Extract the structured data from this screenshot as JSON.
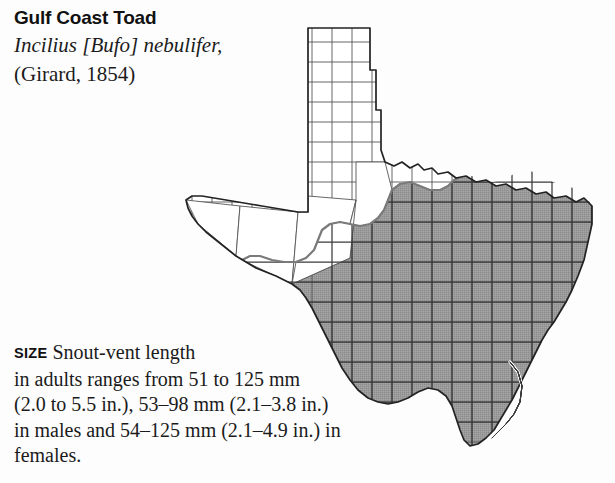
{
  "species": {
    "common_name": "Gulf Coast Toad",
    "scientific_name": "Incilius [Bufo] nebulifer,",
    "authority": "(Girard, 1854)"
  },
  "size_section": {
    "label": "SIZE",
    "lines": [
      " Snout-vent length",
      "in adults ranges from 51 to 125 mm",
      "(2.0 to 5.5 in.), 53–98 mm (2.1–3.8 in.)",
      "in males and 54–125 mm (2.1–4.9 in.) in",
      "females."
    ]
  },
  "map": {
    "name": "texas-range-map",
    "region_label": "Texas",
    "range_shading_color": "#989898",
    "county_line_color": "#4a4a4a",
    "state_outline_color": "#2b2b2b",
    "unshaded_color": "#ffffff",
    "background_color": "#fdfdfd",
    "legend_note": "Shaded area indicates distribution range"
  }
}
